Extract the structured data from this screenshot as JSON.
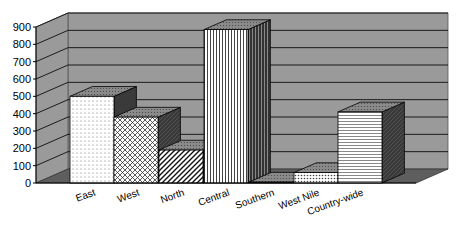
{
  "chart_data": {
    "type": "bar",
    "style": "3d-column",
    "title": "",
    "xlabel": "",
    "ylabel": "",
    "categories": [
      "East",
      "West",
      "North",
      "Central",
      "Southern",
      "West Nile",
      "Country-wide"
    ],
    "values": [
      500,
      380,
      190,
      885,
      5,
      60,
      410
    ],
    "ylim": [
      0,
      900
    ],
    "yticks": [
      "0",
      "100",
      "200",
      "300",
      "400",
      "500",
      "600",
      "700",
      "800",
      "900"
    ],
    "grid": true,
    "legend": null,
    "patterns": [
      "dots",
      "diagonal-crosshatch",
      "diagonal-stripes",
      "vertical-stripes",
      "solid-white",
      "dense-dots",
      "zigzag"
    ]
  },
  "colors": {
    "wall": "#9a9a9a",
    "floor": "#5e5e5e",
    "gridline": "#1a1a1a",
    "bar_side": "#3a3a3a",
    "bar_top": "#8a8a8a",
    "bar_face": "#ffffff"
  }
}
